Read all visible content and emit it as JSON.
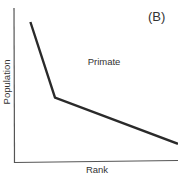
{
  "chart_data": {
    "type": "line",
    "title": "",
    "panel_label": "(B)",
    "annotation": "Primate",
    "xlabel": "Rank",
    "ylabel": "Population",
    "xticks": [],
    "yticks": [],
    "grid": false,
    "legend": null,
    "series": [
      {
        "name": "Primate",
        "points": [
          {
            "x": 1,
            "y": 10
          },
          {
            "x": 2.5,
            "y": 4.6
          },
          {
            "x": 10,
            "y": 1.3
          }
        ]
      }
    ],
    "xlim": [
      0,
      10
    ],
    "ylim": [
      0,
      11
    ],
    "colors": {
      "line": "#2a2a2a",
      "axis": "#555555",
      "text": "#333333"
    }
  },
  "labels": {
    "panel": "(B)",
    "annotation": "Primate",
    "x_axis": "Rank",
    "y_axis": "Population"
  }
}
